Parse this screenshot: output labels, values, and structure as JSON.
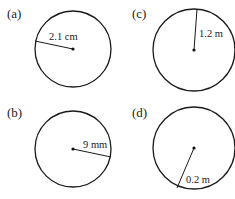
{
  "figure": {
    "panels": [
      {
        "id": "a",
        "label": "(a)",
        "radius_label": "2.1 cm",
        "radius_value": 2.1,
        "unit": "cm",
        "cx": 73,
        "cy": 49,
        "r": 38,
        "edge": [
          35,
          41
        ],
        "text_pos": [
          49,
          40
        ]
      },
      {
        "id": "c",
        "label": "(c)",
        "radius_label": "1.2 m",
        "radius_value": 1.2,
        "unit": "m",
        "cx": 194,
        "cy": 50,
        "r": 41,
        "edge": [
          197,
          9
        ],
        "text_pos": [
          199,
          37
        ]
      },
      {
        "id": "b",
        "label": "(b)",
        "radius_label": "9 mm",
        "radius_value": 9,
        "unit": "mm",
        "cx": 73,
        "cy": 149,
        "r": 38,
        "edge": [
          111,
          157
        ],
        "text_pos": [
          83,
          148
        ]
      },
      {
        "id": "d",
        "label": "(d)",
        "radius_label": "0.2 m",
        "radius_value": 0.2,
        "unit": "m",
        "cx": 194,
        "cy": 148,
        "r": 41,
        "edge": [
          177,
          188
        ],
        "text_pos": [
          186,
          183
        ]
      }
    ],
    "part_label_positions": {
      "a": [
        7,
        18
      ],
      "c": [
        132,
        18
      ],
      "b": [
        7,
        117
      ],
      "d": [
        132,
        117
      ]
    }
  }
}
